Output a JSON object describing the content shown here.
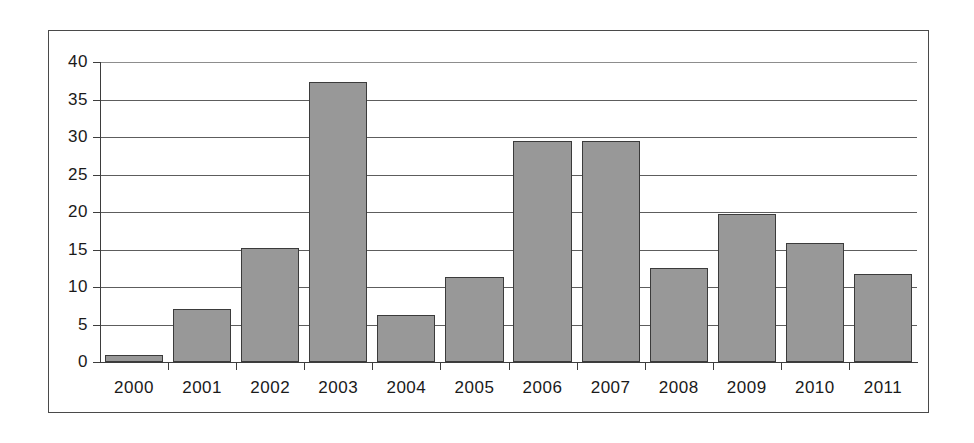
{
  "chart_data": {
    "type": "bar",
    "title": "",
    "subtitle": "",
    "xlabel": "",
    "ylabel": "",
    "categories": [
      "2000",
      "2001",
      "2002",
      "2003",
      "2004",
      "2005",
      "2006",
      "2007",
      "2008",
      "2009",
      "2010",
      "2011"
    ],
    "values": [
      1.0,
      7.1,
      15.2,
      37.3,
      6.3,
      11.3,
      29.5,
      29.5,
      12.6,
      19.7,
      15.9,
      11.8
    ],
    "series": [
      {
        "name": "",
        "values": [
          1.0,
          7.1,
          15.2,
          37.3,
          6.3,
          11.3,
          29.5,
          29.5,
          12.6,
          19.7,
          15.9,
          11.8
        ]
      }
    ],
    "ylim": [
      0,
      40
    ],
    "xlim": [
      0,
      12
    ],
    "ytick_labels": [
      "0",
      "5",
      "10",
      "15",
      "20",
      "25",
      "30",
      "35",
      "40"
    ],
    "ytick_values": [
      0,
      5,
      10,
      15,
      20,
      25,
      30,
      35,
      40
    ],
    "grid": true,
    "grid_axis": "y",
    "legend": false,
    "legend_position": "none",
    "bar_color": "#989898",
    "bar_edge_color": "#3b3b3b",
    "grid_color": "#5d5d5d",
    "axis_color": "#3d3d3d",
    "frame_color": "#4a4a4a",
    "background_color": "#ffffff",
    "annotations": []
  }
}
